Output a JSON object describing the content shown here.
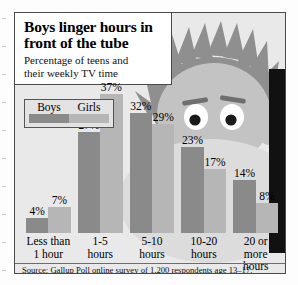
{
  "header": {
    "headline_line1": "Boys linger hours in",
    "headline_line2": "front of the tube",
    "subhead_line1": "Percentage of teens and",
    "subhead_line2": "their weekly TV time"
  },
  "legend": {
    "boys_label": "Boys",
    "girls_label": "Girls",
    "boys_color": "#8a8a8a",
    "girls_color": "#b6b6b6"
  },
  "source": "Source: Gallup Poll online survey of 1,200 respondents age 13–17.",
  "colors": {
    "panel_background": "#e9e9e9",
    "panel_border": "#4a4a4a",
    "header_background": "#ffffff",
    "face": "#c3c3c3",
    "hair": "#8f8f8f",
    "eye_white": "#ffffff",
    "pupil": "#1a1a1a",
    "eyebrow": "#6f6f6f",
    "shoulder": "#dcdcdc",
    "right_band": "#111111"
  },
  "chart_data": {
    "type": "bar",
    "title": "Boys linger hours in front of the tube",
    "subtitle": "Percentage of teens and their weekly TV time",
    "categories": [
      "Less than 1 hour",
      "1-5 hours",
      "5-10 hours",
      "10-20 hours",
      "20 or more hours"
    ],
    "category_lines": [
      [
        "Less than",
        "1 hour"
      ],
      [
        "1-5",
        "hours"
      ],
      [
        "5-10",
        "hours"
      ],
      [
        "10-20",
        "hours"
      ],
      [
        "20 or more",
        "hours"
      ]
    ],
    "series": [
      {
        "name": "Boys",
        "values": [
          4,
          27,
          32,
          23,
          14
        ],
        "color": "#8a8a8a"
      },
      {
        "name": "Girls",
        "values": [
          7,
          37,
          29,
          17,
          8
        ],
        "color": "#b6b6b6"
      }
    ],
    "value_labels": [
      [
        "4%",
        "7%"
      ],
      [
        "27%",
        "37%"
      ],
      [
        "32%",
        "29%"
      ],
      [
        "23%",
        "17%"
      ],
      [
        "14%",
        "8%"
      ]
    ],
    "xlabel": "",
    "ylabel": "",
    "ylim": [
      0,
      40
    ],
    "grid": false,
    "legend_position": "top-left",
    "source": "Source: Gallup Poll online survey of 1,200 respondents age 13–17."
  }
}
